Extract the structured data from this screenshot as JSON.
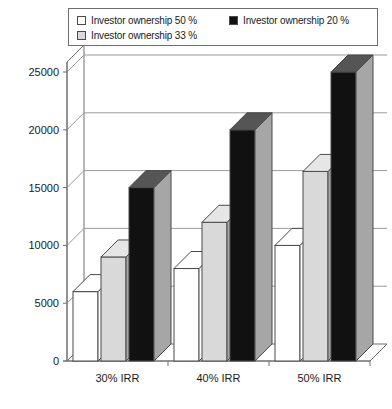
{
  "legend": {
    "entries": [
      {
        "label": "Investor ownership 50 %",
        "color": "#ffffff",
        "icon": "legend-swatch-white"
      },
      {
        "label": "Investor ownership 20 %",
        "color": "#111111",
        "icon": "legend-swatch-black"
      },
      {
        "label": "Investor ownership 33 %",
        "color": "#d9d9d9",
        "icon": "legend-swatch-gray"
      }
    ]
  },
  "chart_data": {
    "type": "bar",
    "title": "",
    "subtitle": "",
    "xlabel": "",
    "ylabel": "",
    "categories": [
      "30% IRR",
      "40% IRR",
      "50% IRR"
    ],
    "series": [
      {
        "name": "Investor ownership 50 %",
        "color": "#ffffff",
        "values": [
          6000,
          8000,
          10000
        ]
      },
      {
        "name": "Investor ownership 33 %",
        "color": "#d9d9d9",
        "values": [
          9000,
          12000,
          16400
        ]
      },
      {
        "name": "Investor ownership 20 %",
        "color": "#111111",
        "values": [
          15000,
          20000,
          25000
        ]
      }
    ],
    "ylim": [
      0,
      26500
    ],
    "yticks": [
      0,
      5000,
      10000,
      15000,
      20000,
      25000
    ],
    "ytick_labels": [
      "0",
      "5000",
      "10000",
      "15000",
      "20000",
      "25000"
    ],
    "grid": true,
    "grid_axis": "y",
    "legend_position": "top",
    "style": "3d-columns",
    "axis_color": "#6e6e6e",
    "grid_color": "#9a9a9a",
    "bar_edge_color": "#4a4a4a",
    "side_face_color": "#a6a6a6",
    "top_face_color": "#bfbfbf"
  }
}
